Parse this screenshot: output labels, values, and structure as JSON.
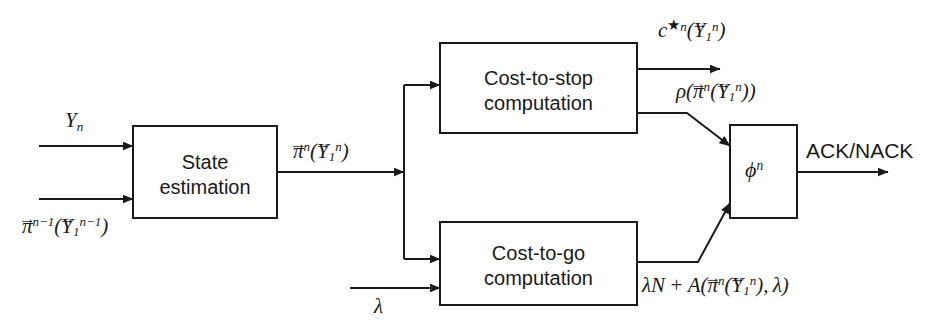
{
  "figure": {
    "type": "block-diagram",
    "background_color": "#ffffff",
    "line_color": "#1a1a1a"
  },
  "blocks": [
    {
      "id": "state-estimation",
      "line1": "State",
      "line2": "estimation",
      "x": 133,
      "y": 126,
      "w": 144,
      "h": 92
    },
    {
      "id": "cost-to-stop",
      "line1": "Cost-to-stop",
      "line2": "computation",
      "x": 440,
      "y": 43,
      "w": 197,
      "h": 90
    },
    {
      "id": "cost-to-go",
      "line1": "Cost-to-go",
      "line2": "computation",
      "x": 440,
      "y": 222,
      "w": 197,
      "h": 83
    },
    {
      "id": "phi",
      "line1": "",
      "line2": "",
      "x": 730,
      "y": 125,
      "w": 67,
      "h": 93
    }
  ],
  "labels": {
    "input_observation": "Y_n",
    "input_prior_belief": "pi^{n-1}(Y_1^{n-1})",
    "belief_state": "pi^n(Y_1^n)",
    "cost_to_stop_out": "c^{*n}(Y_1^n)",
    "rho_out": "rho(pi^n(Y_1^n))",
    "lambda_in": "lambda",
    "cost_to_go_out": "lambda N + A(pi^n(Y_1^n), lambda)",
    "phi_block": "phi^n",
    "decision_out": "ACK/NACK"
  },
  "decision_output_text": "ACK/NACK",
  "arrows": [
    {
      "name": "observation-input",
      "from": "left-edge",
      "to": "state-estimation"
    },
    {
      "name": "prior-belief-input",
      "from": "left-edge",
      "to": "state-estimation"
    },
    {
      "name": "belief-state-bus",
      "from": "state-estimation",
      "to": "branch-node"
    },
    {
      "name": "branch-to-cost-to-stop",
      "from": "branch-node",
      "to": "cost-to-stop"
    },
    {
      "name": "branch-to-cost-to-go",
      "from": "branch-node",
      "to": "cost-to-go"
    },
    {
      "name": "lambda-input",
      "from": "left-edge",
      "to": "cost-to-go"
    },
    {
      "name": "cost-to-stop-primary-output",
      "from": "cost-to-stop",
      "to": "right-edge"
    },
    {
      "name": "rho-to-phi",
      "from": "cost-to-stop",
      "to": "phi"
    },
    {
      "name": "cost-to-go-to-phi",
      "from": "cost-to-go",
      "to": "phi"
    },
    {
      "name": "phi-decision-output",
      "from": "phi",
      "to": "right-edge"
    }
  ]
}
